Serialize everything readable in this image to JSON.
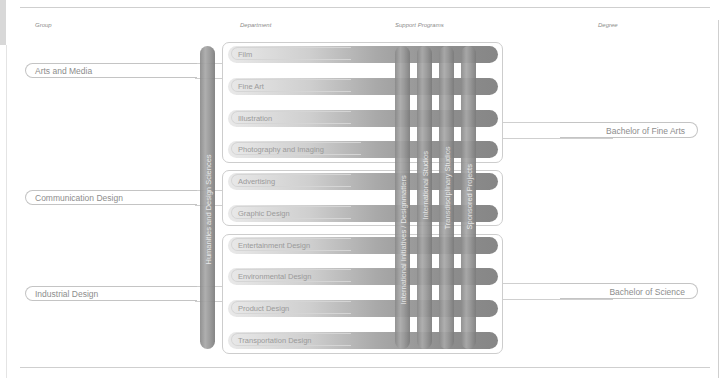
{
  "headers": {
    "group": "Group",
    "department": "Department",
    "support_programs": "Support Programs",
    "degree": "Degree"
  },
  "groups": [
    {
      "label": "Arts and Media"
    },
    {
      "label": "Communication Design"
    },
    {
      "label": "Industrial Design"
    }
  ],
  "departments": [
    {
      "label": "Film"
    },
    {
      "label": "Fine Art"
    },
    {
      "label": "Illustration"
    },
    {
      "label": "Photography and Imaging"
    },
    {
      "label": "Advertising"
    },
    {
      "label": "Graphic Design"
    },
    {
      "label": "Entertainment Design"
    },
    {
      "label": "Environmental Design"
    },
    {
      "label": "Product Design"
    },
    {
      "label": "Transportation Design"
    }
  ],
  "shared_program": {
    "label": "Humanities and Design Sciences"
  },
  "support_programs": [
    {
      "label": "International Initiatives / Designmatters"
    },
    {
      "label": "International Studios"
    },
    {
      "label": "Transdisciplinary Studios"
    },
    {
      "label": "Sponsored Projects"
    }
  ],
  "degrees": [
    {
      "label": "Bachelor of Fine Arts"
    },
    {
      "label": "Bachelor of Science"
    }
  ],
  "colors": {
    "line": "#cfcfcf",
    "text": "#8d8d8d",
    "bar_dark": "#868686",
    "bar_light": "#e9e9e9"
  }
}
